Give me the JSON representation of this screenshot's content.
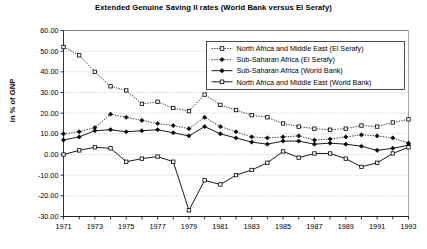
{
  "chart_data": {
    "type": "line",
    "title": "Extended Genuine Saving II rates (World Bank versus El Serafy)",
    "xlabel": "",
    "ylabel": "in % of GNP",
    "xlim": [
      1971,
      1993
    ],
    "ylim": [
      -30,
      60
    ],
    "ytick_step": 10,
    "grid": true,
    "legend_position": "top-right",
    "x": [
      1971,
      1972,
      1973,
      1974,
      1975,
      1976,
      1977,
      1978,
      1979,
      1980,
      1981,
      1982,
      1983,
      1984,
      1985,
      1986,
      1987,
      1988,
      1989,
      1990,
      1991,
      1992,
      1993
    ],
    "xtick_labels": [
      "1971",
      "",
      "1973",
      "",
      "1975",
      "",
      "1977",
      "",
      "1979",
      "",
      "1981",
      "",
      "1983",
      "",
      "1985",
      "",
      "1987",
      "",
      "1989",
      "",
      "1991",
      "",
      "1993"
    ],
    "ytick_labels": [
      "60.00",
      "50.00",
      "40.00",
      "30.00",
      "20.00",
      "10.00",
      "0.00",
      "-10.00",
      "-20.00",
      "-30.00"
    ],
    "series": [
      {
        "name": "North Africa and Middle East (El Serafy)",
        "marker": "open-square",
        "line": "dotted",
        "values": [
          52.0,
          48.0,
          40.0,
          33.0,
          31.0,
          24.5,
          25.5,
          22.5,
          21.0,
          29.0,
          24.0,
          21.5,
          19.0,
          18.0,
          15.0,
          13.5,
          12.5,
          12.0,
          12.5,
          14.0,
          13.5,
          15.5,
          17.0
        ]
      },
      {
        "name": "Sub-Saharan Africa (El Serafy)",
        "marker": "solid-diamond",
        "line": "dotted",
        "values": [
          10.0,
          11.0,
          13.0,
          19.5,
          18.0,
          16.5,
          15.0,
          14.0,
          12.5,
          18.0,
          13.5,
          11.0,
          8.5,
          8.0,
          8.5,
          9.0,
          7.0,
          7.5,
          8.5,
          9.5,
          9.0,
          8.0,
          5.5
        ]
      },
      {
        "name": "Sub-Saharan Africa (World Bank)",
        "marker": "solid-diamond",
        "line": "solid",
        "values": [
          7.0,
          8.5,
          11.5,
          12.0,
          11.0,
          11.5,
          12.0,
          10.5,
          9.0,
          13.5,
          10.0,
          8.0,
          6.0,
          5.0,
          6.5,
          6.5,
          5.0,
          5.5,
          5.0,
          4.0,
          2.0,
          3.0,
          4.5
        ]
      },
      {
        "name": "North Africa and Middle East (World Bank)",
        "marker": "open-square",
        "line": "solid",
        "values": [
          0.0,
          2.0,
          3.5,
          3.0,
          -3.5,
          -2.0,
          -1.0,
          -3.5,
          -27.0,
          -12.5,
          -14.5,
          -10.0,
          -7.5,
          -4.0,
          1.5,
          -1.5,
          0.5,
          0.5,
          -2.0,
          -6.0,
          -4.0,
          0.5,
          3.5
        ]
      }
    ]
  },
  "legend": {
    "items": [
      {
        "label": "North Africa and Middle East (El Serafy)"
      },
      {
        "label": "Sub-Saharan Africa (El Serafy)"
      },
      {
        "label": "Sub-Saharan Africa (World Bank)"
      },
      {
        "label": "North Africa and Middle East (World Bank)"
      }
    ]
  }
}
